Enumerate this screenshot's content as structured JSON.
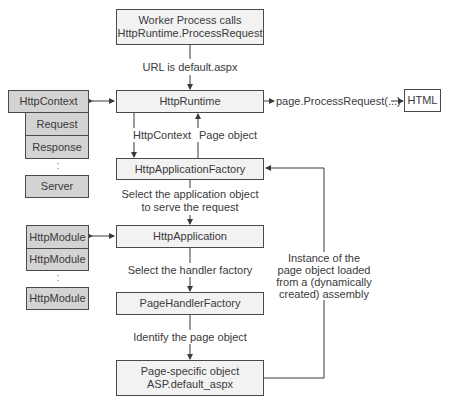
{
  "diagram": {
    "nodes": {
      "worker": {
        "line1": "Worker Process calls",
        "line2": "HttpRuntime.ProcessRequest"
      },
      "httpRuntime": "HttpRuntime",
      "httpApplicationFactory": "HttpApplicationFactory",
      "httpApplication": "HttpApplication",
      "pageHandlerFactory": "PageHandlerFactory",
      "pageObject": {
        "line1": "Page-specific object",
        "line2": "ASP.default_aspx"
      },
      "html": "HTML"
    },
    "context_group": {
      "header": "HttpContext",
      "items": [
        "Request",
        "Response"
      ],
      "ellipsis": ":",
      "last": "Server"
    },
    "module_group": {
      "items": [
        "HttpModule",
        "HttpModule"
      ],
      "ellipsis": ":",
      "last": "HttpModule"
    },
    "edge_labels": {
      "url": "URL is default.aspx",
      "process_request": "page.ProcessRequest(...)",
      "http_context": "HttpContext",
      "page_object": "Page object",
      "select_app_line1": "Select the application object",
      "select_app_line2": "to serve the request",
      "select_handler": "Select the handler factory",
      "identify_page": "Identify the page object",
      "instance_line1": "Instance of the",
      "instance_line2": "page object loaded",
      "instance_line3": "from a (dynamically",
      "instance_line4": "created) assembly"
    },
    "colors": {
      "box_light": "#f2f2f2",
      "box_gray": "#d3d3d3",
      "stroke": "#4a4a4a",
      "text": "#3a3a3a"
    }
  }
}
